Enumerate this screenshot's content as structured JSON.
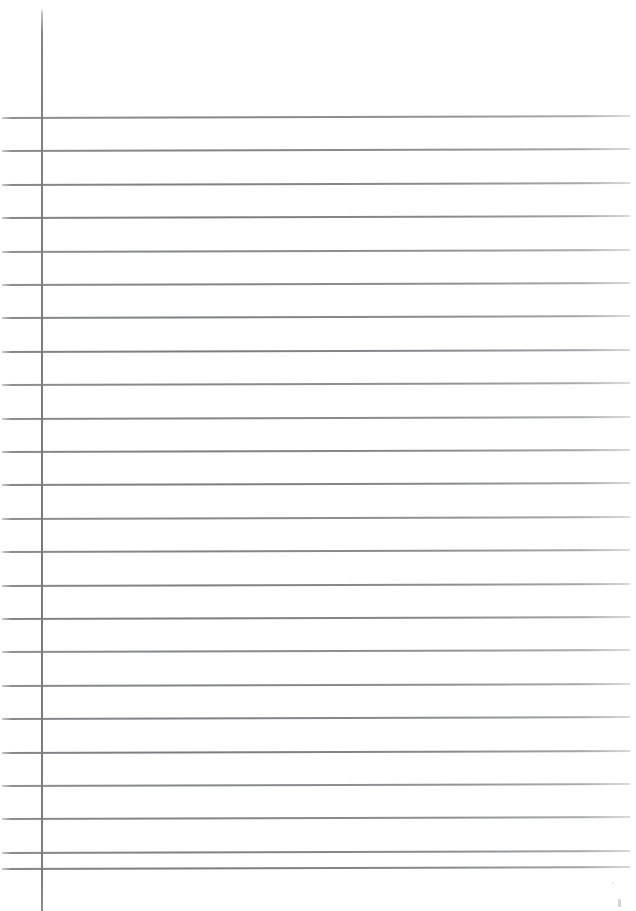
{
  "document": {
    "kind": "scanned-lined-notebook-page",
    "title": "Lined Notebook Paper",
    "orientation": "portrait",
    "page_width": 636,
    "page_height": 911,
    "background_color": "#ffffff",
    "content_text": "",
    "is_blank": "true",
    "written_content_note": "No handwriting or printed text present on the page"
  },
  "ruling": {
    "line_color": "#76787c",
    "line_thickness": 2,
    "line_spacing": 33.4,
    "first_line_y": 117,
    "line_count": 24,
    "line_start_x": 2,
    "line_end_x": 630,
    "line_tilt_degrees": -0.18,
    "top_margin_blank_height": 117,
    "line_y_positions": [
      117,
      150.4,
      183.8,
      217.2,
      250.6,
      284,
      317.4,
      350.8,
      384.2,
      417.6,
      451,
      484.4,
      517.8,
      551.2,
      584.6,
      618,
      651.4,
      684.8,
      718.2,
      751.6,
      785,
      818.4,
      851.8,
      868
    ]
  },
  "margin_rule": {
    "label": "vertical margin rule",
    "color": "#70727 6",
    "x": 41,
    "top_y": 8,
    "bottom_y": 911,
    "thickness": 2
  },
  "artifacts": {
    "speck_label": "scanner speck",
    "speck_x": 618,
    "speck_y": 899
  }
}
